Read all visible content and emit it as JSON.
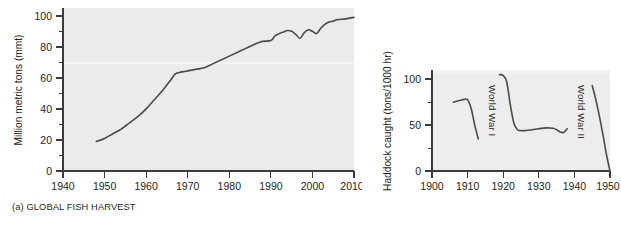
{
  "figure": {
    "background_color": "#ffffff",
    "plot_background_color": "#ebebeb",
    "line_color": "#4a4a4a",
    "text_color": "#231f20"
  },
  "panels": [
    {
      "id": "panel-a",
      "caption": "(a) GLOBAL FISH HARVEST"
    },
    {
      "id": "panel-b",
      "caption": "(b) HADDOCK CATCH IN NORTH SEA"
    }
  ],
  "chart_data": [
    {
      "type": "line",
      "title": "(a) GLOBAL FISH HARVEST",
      "xlabel": "",
      "ylabel": "Million metric tons (mmt)",
      "xlim": [
        1940,
        2010
      ],
      "ylim": [
        0,
        105
      ],
      "grid": false,
      "legend": null,
      "xticks": [
        1940,
        1950,
        1960,
        1970,
        1980,
        1990,
        2000,
        2010
      ],
      "xtick_labels": [
        "1940",
        "1950",
        "1960",
        "1970",
        "1980",
        "1990",
        "2000",
        "2010"
      ],
      "yticks": [
        0,
        20,
        40,
        60,
        80,
        100
      ],
      "ytick_labels": [
        "0",
        "20",
        "40",
        "60",
        "80",
        "100"
      ],
      "yticks_minor": [
        10,
        30,
        50,
        70,
        90
      ],
      "series": [
        {
          "name": "Global fish harvest",
          "x": [
            1948,
            1950,
            1952,
            1954,
            1956,
            1958,
            1960,
            1962,
            1964,
            1966,
            1967,
            1968,
            1969,
            1970,
            1972,
            1974,
            1976,
            1978,
            1980,
            1982,
            1984,
            1986,
            1988,
            1990,
            1991,
            1992,
            1993,
            1994,
            1995,
            1996,
            1997,
            1998,
            1999,
            2000,
            2001,
            2002,
            2003,
            2004,
            2005,
            2006,
            2008,
            2010
          ],
          "values": [
            19,
            21,
            24,
            27,
            31,
            35,
            40,
            46,
            52,
            59,
            62.5,
            63.5,
            64,
            64.5,
            65.5,
            66.5,
            69,
            71.5,
            74,
            76.5,
            79,
            81.5,
            83.5,
            84,
            87,
            88.5,
            89.5,
            90.5,
            90,
            88,
            85.5,
            89,
            91,
            90,
            88.5,
            92,
            94.5,
            96,
            96.5,
            97.5,
            98,
            99
          ]
        }
      ]
    },
    {
      "type": "line",
      "title": "(b) HADDOCK CATCH IN NORTH SEA",
      "xlabel": "",
      "ylabel": "Haddock caught (tons/1000 hr)",
      "xlim": [
        1900,
        1950
      ],
      "ylim": [
        0,
        110
      ],
      "grid": false,
      "legend": null,
      "xticks": [
        1900,
        1910,
        1920,
        1930,
        1940,
        1950
      ],
      "xtick_labels": [
        "1900",
        "1910",
        "1920",
        "1930",
        "1940",
        "1950"
      ],
      "yticks": [
        0,
        50,
        100
      ],
      "ytick_labels": [
        "0",
        "50",
        "100"
      ],
      "yticks_minor": [
        25,
        75
      ],
      "annotations": [
        {
          "text": "World War I",
          "x": 1916,
          "rotation": 90
        },
        {
          "text": "World War II",
          "x": 1941,
          "rotation": 90
        }
      ],
      "series": [
        {
          "name": "Pre-World War I",
          "x": [
            1906,
            1907,
            1908,
            1909,
            1910,
            1911,
            1912,
            1913
          ],
          "values": [
            75,
            76,
            77,
            78,
            77.5,
            68,
            50,
            35
          ]
        },
        {
          "name": "Between the wars",
          "x": [
            1919,
            1920,
            1921,
            1922,
            1923,
            1924,
            1925,
            1926,
            1928,
            1930,
            1932,
            1934,
            1935,
            1936,
            1937,
            1938
          ],
          "values": [
            105,
            104,
            97,
            72,
            52,
            45,
            44,
            44,
            45,
            46,
            47,
            46.5,
            45,
            42.5,
            42,
            46
          ]
        },
        {
          "name": "Post-World War II",
          "x": [
            1945,
            1946,
            1947,
            1948,
            1949,
            1950
          ],
          "values": [
            93,
            78,
            60,
            40,
            18,
            0
          ]
        }
      ]
    }
  ]
}
